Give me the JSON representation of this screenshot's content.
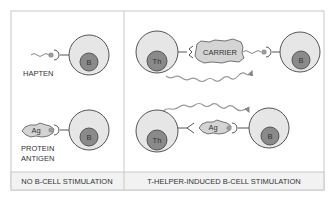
{
  "panels": {
    "left": {
      "footer": "NO B-CELL STIMULATION",
      "hapten_label": "HAPTEN",
      "protein_label_line1": "PROTEIN",
      "protein_label_line2": "ANTIGEN",
      "b_cell_1": "B",
      "b_cell_2": "B",
      "antigen": "Ag"
    },
    "right": {
      "footer": "T-HELPER-INDUCED B-CELL STIMULATION",
      "carrier": "CARRIER",
      "th_cell_1": "Th",
      "th_cell_2": "Th",
      "b_cell_1": "B",
      "b_cell_2": "B",
      "antigen": "Ag"
    }
  },
  "colors": {
    "border": "#c8c8c8",
    "cell_outer": "#e6e6e6",
    "cell_outer_stroke": "#555555",
    "nucleus": "#8a8a8a",
    "antigen_fill": "#d4d4d4",
    "footer_bg": "#f2f2f2"
  }
}
